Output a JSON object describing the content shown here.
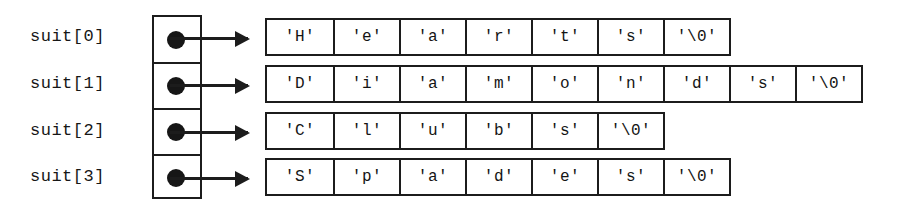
{
  "diagram": {
    "colors": {
      "background": "#ffffff",
      "stroke": "#1c1c1c",
      "text": "#141414",
      "dot": "#161616"
    },
    "pointer_array": {
      "name": "suit",
      "entries": [
        {
          "label": "suit[0]",
          "marker": "filled-dot"
        },
        {
          "label": "suit[1]",
          "marker": "filled-dot"
        },
        {
          "label": "suit[2]",
          "marker": "filled-dot"
        },
        {
          "label": "suit[3]",
          "marker": "filled-dot"
        }
      ]
    },
    "strings": [
      {
        "index": 0,
        "word": "Hearts",
        "cells": [
          "'H'",
          "'e'",
          "'a'",
          "'r'",
          "'t'",
          "'s'",
          "'\\0'"
        ]
      },
      {
        "index": 1,
        "word": "Diamonds",
        "cells": [
          "'D'",
          "'i'",
          "'a'",
          "'m'",
          "'o'",
          "'n'",
          "'d'",
          "'s'",
          "'\\0'"
        ]
      },
      {
        "index": 2,
        "word": "Clubs",
        "cells": [
          "'C'",
          "'l'",
          "'u'",
          "'b'",
          "'s'",
          "'\\0'"
        ]
      },
      {
        "index": 3,
        "word": "Spades",
        "cells": [
          "'S'",
          "'p'",
          "'a'",
          "'d'",
          "'e'",
          "'s'",
          "'\\0'"
        ]
      }
    ]
  }
}
